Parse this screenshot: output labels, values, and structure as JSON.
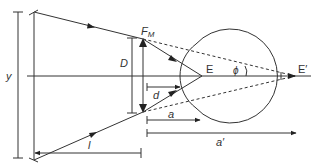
{
  "diagram": {
    "type": "optical ray diagram: magnifier in front of eye",
    "colors": {
      "line": "#333333",
      "background": "#ffffff"
    },
    "labels": {
      "y": "y",
      "D": "D",
      "F_M": "F",
      "F_M_sub": "M",
      "d": "d",
      "E": "E",
      "E_prime": "E′",
      "phi": "ϕ",
      "a": "a",
      "a_prime": "a′",
      "l": "l"
    },
    "elements": [
      {
        "name": "object-height-bar",
        "label": "y"
      },
      {
        "name": "object",
        "label": ""
      },
      {
        "name": "lens-aperture",
        "label": "D"
      },
      {
        "name": "lens",
        "label": "F_M"
      },
      {
        "name": "eye",
        "label": "E"
      },
      {
        "name": "virtual-focus",
        "label": "E′"
      },
      {
        "name": "angle",
        "label": "ϕ"
      },
      {
        "name": "distance-d",
        "label": "d"
      },
      {
        "name": "distance-a",
        "label": "a"
      },
      {
        "name": "distance-a-prime",
        "label": "a′"
      },
      {
        "name": "distance-l",
        "label": "l"
      }
    ]
  }
}
